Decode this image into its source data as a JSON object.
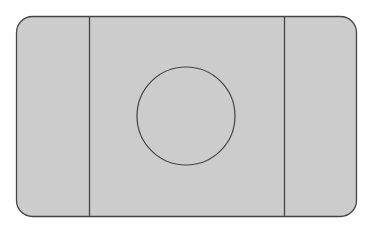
{
  "diagram": {
    "type": "court-layout",
    "background": "#ffffff",
    "field": {
      "x": 16,
      "y": 16,
      "width": 340,
      "height": 200,
      "corner_radius": 16,
      "fill": "#cccccc",
      "stroke": "#444444"
    },
    "lines": [
      {
        "name": "left-line",
        "x": 89
      },
      {
        "name": "right-line",
        "x": 284
      }
    ],
    "center_circle": {
      "cx": 186,
      "cy": 116,
      "r": 49
    },
    "line_color": "#444444"
  }
}
